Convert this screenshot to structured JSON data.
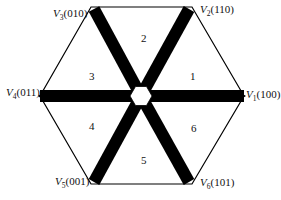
{
  "diagram": {
    "vertices": [
      {
        "id": "V1",
        "name": "V",
        "sub": "1",
        "code": "(100)"
      },
      {
        "id": "V2",
        "name": "V",
        "sub": "2",
        "code": "(110)"
      },
      {
        "id": "V3",
        "name": "V",
        "sub": "3",
        "code": "(010)"
      },
      {
        "id": "V4",
        "name": "V",
        "sub": "4",
        "code": "(011)"
      },
      {
        "id": "V5",
        "name": "V",
        "sub": "5",
        "code": "(001)"
      },
      {
        "id": "V6",
        "name": "V",
        "sub": "6",
        "code": "(101)"
      }
    ],
    "sectors": [
      "1",
      "2",
      "3",
      "4",
      "5",
      "6"
    ],
    "colors": {
      "stroke": "#000000",
      "spoke": "#000000",
      "background": "#ffffff"
    }
  }
}
